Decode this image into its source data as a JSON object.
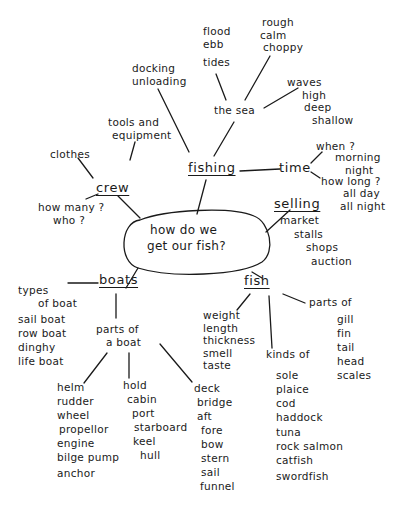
{
  "title": "how do we get our fish?",
  "center": {
    "line1": "how do we",
    "line2": "get our fish?"
  },
  "branches": {
    "fishing": {
      "label": "fishing",
      "docking": [
        "docking",
        "unloading"
      ],
      "the_sea": {
        "label": "the sea",
        "tides": {
          "items": [
            "flood",
            "ebb"
          ],
          "label": "tides"
        },
        "rough": [
          "rough",
          "calm",
          "choppy"
        ],
        "waves": [
          "waves",
          "high",
          "deep",
          "shallow"
        ]
      },
      "tools": [
        "tools and",
        "equipment"
      ],
      "time": {
        "label": "time",
        "when": "when ?",
        "when_items": [
          "morning",
          "night"
        ],
        "how_long": "how long ?",
        "how_long_items": [
          "all day",
          "all night"
        ]
      }
    },
    "crew": {
      "label": "crew",
      "clothes": "clothes",
      "questions": [
        "how many ?",
        "who ?"
      ]
    },
    "selling": {
      "label": "selling",
      "items": [
        "market",
        "stalls",
        "shops",
        "auction"
      ]
    },
    "boats": {
      "label": "boats",
      "types_label": [
        "types",
        "of boat"
      ],
      "types": [
        "sail boat",
        "row boat",
        "dinghy",
        "life boat"
      ],
      "parts_label": [
        "parts of",
        "a boat"
      ],
      "helm": [
        "helm",
        "rudder",
        "wheel",
        "propellor",
        "engine",
        "bilge pump",
        "anchor"
      ],
      "hold": [
        "hold",
        "cabin",
        "port",
        "starboard",
        "keel",
        "hull"
      ],
      "deck": [
        "deck",
        "bridge",
        "aft",
        "fore",
        "bow",
        "stern",
        "sail",
        "funnel"
      ]
    },
    "fish": {
      "label": "fish",
      "qualities": [
        "weight",
        "length",
        "thickness",
        "smell",
        "taste"
      ],
      "kinds_label": "kinds of",
      "kinds": [
        "sole",
        "plaice",
        "cod",
        "haddock",
        "tuna",
        "rock salmon",
        "catfish",
        "swordfish"
      ],
      "parts_label": "parts of",
      "parts": [
        "gill",
        "fin",
        "tail",
        "head",
        "scales"
      ]
    }
  }
}
